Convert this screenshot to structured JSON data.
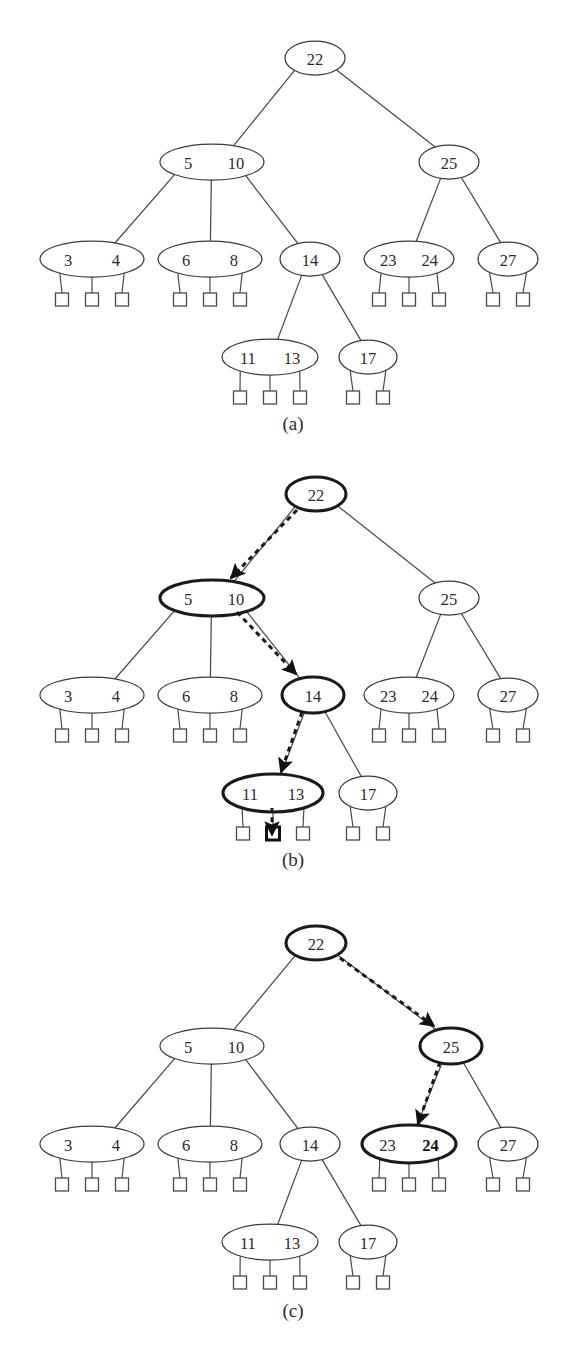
{
  "figure": {
    "width": 580,
    "height": 1350,
    "background": "#ffffff",
    "line_color": "#4a4a4a",
    "bold_color": "#111111",
    "text_color": "#2b2b2b",
    "arrow_color": "#1a1a1a"
  },
  "chart_data": {
    "type": "diagram",
    "diagram_kind": "b-tree",
    "panels": [
      {
        "id": "a",
        "label": "(a)",
        "caption": "Base B-tree with no search path highlighted",
        "label_x": 293,
        "label_y": 423,
        "nodes": [
          {
            "id": "a-root",
            "keys": [
              "22"
            ],
            "bold_keys": [],
            "cx": 315,
            "cy": 58,
            "rx": 30,
            "ry": 17,
            "bold": false,
            "leaves": []
          },
          {
            "id": "a-n510",
            "keys": [
              "5",
              "10"
            ],
            "bold_keys": [],
            "cx": 212,
            "cy": 162,
            "rx": 52,
            "ry": 18,
            "bold": false,
            "leaves": []
          },
          {
            "id": "a-n25",
            "keys": [
              "25"
            ],
            "bold_keys": [],
            "cx": 449,
            "cy": 162,
            "rx": 30,
            "ry": 17,
            "bold": false,
            "leaves": []
          },
          {
            "id": "a-n34",
            "keys": [
              "3",
              "4"
            ],
            "bold_keys": [],
            "cx": 92,
            "cy": 259,
            "rx": 52,
            "ry": 18,
            "bold": false,
            "leaves": [
              62,
              92,
              122
            ]
          },
          {
            "id": "a-n68",
            "keys": [
              "6",
              "8"
            ],
            "bold_keys": [],
            "cx": 210,
            "cy": 259,
            "rx": 52,
            "ry": 18,
            "bold": false,
            "leaves": [
              180,
              210,
              240
            ]
          },
          {
            "id": "a-n14",
            "keys": [
              "14"
            ],
            "bold_keys": [],
            "cx": 310,
            "cy": 259,
            "rx": 30,
            "ry": 17,
            "bold": false,
            "leaves": []
          },
          {
            "id": "a-n2324",
            "keys": [
              "23",
              "24"
            ],
            "bold_keys": [],
            "cx": 409,
            "cy": 259,
            "rx": 45,
            "ry": 18,
            "bold": false,
            "leaves": [
              379,
              409,
              439
            ]
          },
          {
            "id": "a-n27",
            "keys": [
              "27"
            ],
            "bold_keys": [],
            "cx": 508,
            "cy": 259,
            "rx": 30,
            "ry": 17,
            "bold": false,
            "leaves": [
              493,
              523
            ]
          },
          {
            "id": "a-n1113",
            "keys": [
              "11",
              "13"
            ],
            "bold_keys": [],
            "cx": 270,
            "cy": 357,
            "rx": 48,
            "ry": 18,
            "bold": false,
            "leaves": [
              240,
              270,
              300
            ]
          },
          {
            "id": "a-n17",
            "keys": [
              "17"
            ],
            "bold_keys": [],
            "cx": 368,
            "cy": 357,
            "rx": 29,
            "ry": 17,
            "bold": false,
            "leaves": [
              353,
              383
            ]
          }
        ],
        "edges": [
          {
            "from": "a-root",
            "to": "a-n510"
          },
          {
            "from": "a-root",
            "to": "a-n25"
          },
          {
            "from": "a-n510",
            "to": "a-n34"
          },
          {
            "from": "a-n510",
            "to": "a-n68"
          },
          {
            "from": "a-n510",
            "to": "a-n14"
          },
          {
            "from": "a-n25",
            "to": "a-n2324"
          },
          {
            "from": "a-n25",
            "to": "a-n27"
          },
          {
            "from": "a-n14",
            "to": "a-n1113"
          },
          {
            "from": "a-n14",
            "to": "a-n17"
          }
        ],
        "arrows": [],
        "bold_leaves": []
      },
      {
        "id": "b",
        "label": "(b)",
        "caption": "Search path 22 to 5-10 to 14 to 11-13 to middle leaf",
        "label_x": 293,
        "label_y": 859,
        "nodes": [
          {
            "id": "b-root",
            "keys": [
              "22"
            ],
            "bold_keys": [],
            "cx": 316,
            "cy": 494,
            "rx": 30,
            "ry": 17,
            "bold": true,
            "leaves": []
          },
          {
            "id": "b-n510",
            "keys": [
              "5",
              "10"
            ],
            "bold_keys": [],
            "cx": 212,
            "cy": 598,
            "rx": 52,
            "ry": 18,
            "bold": true,
            "leaves": []
          },
          {
            "id": "b-n25",
            "keys": [
              "25"
            ],
            "bold_keys": [],
            "cx": 449,
            "cy": 598,
            "rx": 30,
            "ry": 17,
            "bold": false,
            "leaves": []
          },
          {
            "id": "b-n34",
            "keys": [
              "3",
              "4"
            ],
            "bold_keys": [],
            "cx": 92,
            "cy": 695,
            "rx": 52,
            "ry": 18,
            "bold": false,
            "leaves": [
              62,
              92,
              122
            ]
          },
          {
            "id": "b-n68",
            "keys": [
              "6",
              "8"
            ],
            "bold_keys": [],
            "cx": 210,
            "cy": 695,
            "rx": 52,
            "ry": 18,
            "bold": false,
            "leaves": [
              180,
              210,
              240
            ]
          },
          {
            "id": "b-n14",
            "keys": [
              "14"
            ],
            "bold_keys": [],
            "cx": 313,
            "cy": 695,
            "rx": 31,
            "ry": 18,
            "bold": true,
            "leaves": []
          },
          {
            "id": "b-n2324",
            "keys": [
              "23",
              "24"
            ],
            "bold_keys": [],
            "cx": 409,
            "cy": 695,
            "rx": 45,
            "ry": 18,
            "bold": false,
            "leaves": [
              379,
              409,
              439
            ]
          },
          {
            "id": "b-n27",
            "keys": [
              "27"
            ],
            "bold_keys": [],
            "cx": 508,
            "cy": 695,
            "rx": 30,
            "ry": 17,
            "bold": false,
            "leaves": [
              493,
              523
            ]
          },
          {
            "id": "b-n1113",
            "keys": [
              "11",
              "13"
            ],
            "bold_keys": [],
            "cx": 273,
            "cy": 793,
            "rx": 50,
            "ry": 19,
            "bold": true,
            "leaves": [
              243,
              273,
              303
            ]
          },
          {
            "id": "b-n17",
            "keys": [
              "17"
            ],
            "bold_keys": [],
            "cx": 368,
            "cy": 793,
            "rx": 29,
            "ry": 17,
            "bold": false,
            "leaves": [
              353,
              383
            ]
          }
        ],
        "edges": [
          {
            "from": "b-root",
            "to": "b-n510"
          },
          {
            "from": "b-root",
            "to": "b-n25"
          },
          {
            "from": "b-n510",
            "to": "b-n34"
          },
          {
            "from": "b-n510",
            "to": "b-n68"
          },
          {
            "from": "b-n510",
            "to": "b-n14"
          },
          {
            "from": "b-n25",
            "to": "b-n2324"
          },
          {
            "from": "b-n25",
            "to": "b-n27"
          },
          {
            "from": "b-n14",
            "to": "b-n1113"
          },
          {
            "from": "b-n14",
            "to": "b-n17"
          }
        ],
        "arrows": [
          {
            "id": "b-arrow-1",
            "from_label": "22",
            "to_label": "5 10",
            "x1": 297,
            "y1": 510,
            "x2": 231,
            "y2": 578
          },
          {
            "id": "b-arrow-2",
            "from_label": "5 10",
            "to_label": "14",
            "x1": 237,
            "y1": 612,
            "x2": 296,
            "y2": 674
          },
          {
            "id": "b-arrow-3",
            "from_label": "14",
            "to_label": "11 13",
            "x1": 302,
            "y1": 712,
            "x2": 281,
            "y2": 772
          },
          {
            "id": "b-arrow-4",
            "from_label": "11 13",
            "to_label": "middle leaf",
            "x1": 272,
            "y1": 808,
            "x2": 272,
            "y2": 835
          }
        ],
        "bold_leaves": [
          {
            "node": "b-n1113",
            "index": 1
          }
        ]
      },
      {
        "id": "c",
        "label": "(c)",
        "caption": "Search path 22 to 25 to 23-24 with key 24 found",
        "label_x": 293,
        "label_y": 1310,
        "nodes": [
          {
            "id": "c-root",
            "keys": [
              "22"
            ],
            "bold_keys": [],
            "cx": 316,
            "cy": 943,
            "rx": 30,
            "ry": 17,
            "bold": true,
            "leaves": []
          },
          {
            "id": "c-n510",
            "keys": [
              "5",
              "10"
            ],
            "bold_keys": [],
            "cx": 212,
            "cy": 1046,
            "rx": 52,
            "ry": 18,
            "bold": false,
            "leaves": []
          },
          {
            "id": "c-n25",
            "keys": [
              "25"
            ],
            "bold_keys": [],
            "cx": 451,
            "cy": 1046,
            "rx": 31,
            "ry": 18,
            "bold": true,
            "leaves": []
          },
          {
            "id": "c-n34",
            "keys": [
              "3",
              "4"
            ],
            "bold_keys": [],
            "cx": 92,
            "cy": 1144,
            "rx": 52,
            "ry": 18,
            "bold": false,
            "leaves": [
              62,
              92,
              122
            ]
          },
          {
            "id": "c-n68",
            "keys": [
              "6",
              "8"
            ],
            "bold_keys": [],
            "cx": 210,
            "cy": 1144,
            "rx": 52,
            "ry": 18,
            "bold": false,
            "leaves": [
              180,
              210,
              240
            ]
          },
          {
            "id": "c-n14",
            "keys": [
              "14"
            ],
            "bold_keys": [],
            "cx": 310,
            "cy": 1144,
            "rx": 30,
            "ry": 17,
            "bold": false,
            "leaves": []
          },
          {
            "id": "c-n2324",
            "keys": [
              "23",
              "24"
            ],
            "bold_keys": [
              "24"
            ],
            "cx": 409,
            "cy": 1144,
            "rx": 47,
            "ry": 19,
            "bold": true,
            "leaves": [
              379,
              409,
              439
            ]
          },
          {
            "id": "c-n27",
            "keys": [
              "27"
            ],
            "bold_keys": [],
            "cx": 508,
            "cy": 1144,
            "rx": 30,
            "ry": 17,
            "bold": false,
            "leaves": [
              493,
              523
            ]
          },
          {
            "id": "c-n1113",
            "keys": [
              "11",
              "13"
            ],
            "bold_keys": [],
            "cx": 270,
            "cy": 1242,
            "rx": 48,
            "ry": 18,
            "bold": false,
            "leaves": [
              240,
              270,
              300
            ]
          },
          {
            "id": "c-n17",
            "keys": [
              "17"
            ],
            "bold_keys": [],
            "cx": 368,
            "cy": 1242,
            "rx": 29,
            "ry": 17,
            "bold": false,
            "leaves": [
              353,
              383
            ]
          }
        ],
        "edges": [
          {
            "from": "c-root",
            "to": "c-n510"
          },
          {
            "from": "c-root",
            "to": "c-n25"
          },
          {
            "from": "c-n510",
            "to": "c-n34"
          },
          {
            "from": "c-n510",
            "to": "c-n68"
          },
          {
            "from": "c-n510",
            "to": "c-n14"
          },
          {
            "from": "c-n25",
            "to": "c-n2324"
          },
          {
            "from": "c-n25",
            "to": "c-n27"
          },
          {
            "from": "c-n14",
            "to": "c-n1113"
          },
          {
            "from": "c-n14",
            "to": "c-n17"
          }
        ],
        "arrows": [
          {
            "id": "c-arrow-1",
            "from_label": "22",
            "to_label": "25",
            "x1": 340,
            "y1": 958,
            "x2": 434,
            "y2": 1026
          },
          {
            "id": "c-arrow-2",
            "from_label": "25",
            "to_label": "23 24",
            "x1": 440,
            "y1": 1062,
            "x2": 418,
            "y2": 1124
          }
        ],
        "bold_leaves": []
      }
    ],
    "leaf_square": {
      "size": 13,
      "offset_y": 34
    },
    "legend": []
  }
}
